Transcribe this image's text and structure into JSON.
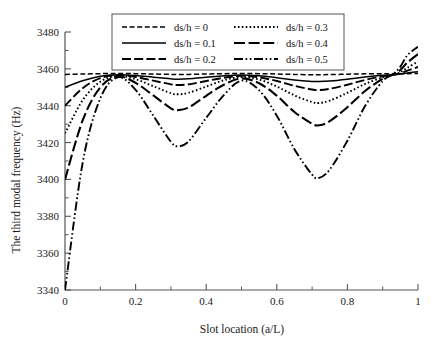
{
  "chart_data": {
    "type": "line",
    "title": "",
    "xlabel": "Slot location (a/L)",
    "ylabel": "The third modal frequency (Hz)",
    "xlim": [
      0,
      1
    ],
    "ylim": [
      3340,
      3480
    ],
    "xticks": [
      "0",
      "0.2",
      "0.4",
      "0.6",
      "0.8",
      "1"
    ],
    "xtick_values": [
      0,
      0.2,
      0.4,
      0.6,
      0.8,
      1
    ],
    "yticks": [
      "3340",
      "3360",
      "3380",
      "3400",
      "3420",
      "3440",
      "3460",
      "3480"
    ],
    "ytick_values": [
      3340,
      3360,
      3380,
      3400,
      3420,
      3440,
      3460,
      3480
    ],
    "grid": false,
    "minor_ticks": true,
    "legend_position": "top-inside",
    "series": [
      {
        "name": "ds/h = 0",
        "style": "dashed",
        "x": [
          0,
          0.05,
          0.1,
          0.15,
          0.2,
          0.25,
          0.3,
          0.32,
          0.35,
          0.4,
          0.45,
          0.5,
          0.55,
          0.6,
          0.65,
          0.7,
          0.72,
          0.75,
          0.8,
          0.85,
          0.9,
          0.93,
          0.95,
          0.97,
          1.0
        ],
        "y": [
          3457.0,
          3457.2,
          3457.4,
          3457.5,
          3457.4,
          3457.2,
          3457.0,
          3456.9,
          3457.0,
          3457.2,
          3457.4,
          3457.5,
          3457.4,
          3457.2,
          3457.0,
          3456.8,
          3456.8,
          3456.9,
          3457.1,
          3457.3,
          3457.4,
          3457.4,
          3457.4,
          3457.4,
          3457.5
        ]
      },
      {
        "name": "ds/h = 0.1",
        "style": "solid",
        "x": [
          0,
          0.05,
          0.1,
          0.15,
          0.2,
          0.25,
          0.3,
          0.32,
          0.35,
          0.4,
          0.45,
          0.5,
          0.55,
          0.6,
          0.65,
          0.7,
          0.72,
          0.75,
          0.8,
          0.85,
          0.9,
          0.93,
          0.95,
          0.97,
          1.0
        ],
        "y": [
          3450.0,
          3453.5,
          3456.0,
          3456.8,
          3456.4,
          3455.5,
          3454.6,
          3454.4,
          3454.6,
          3455.4,
          3456.2,
          3456.6,
          3456.2,
          3455.2,
          3454.0,
          3453.2,
          3453.1,
          3453.4,
          3454.4,
          3455.6,
          3456.5,
          3456.8,
          3457.2,
          3457.8,
          3458.5
        ]
      },
      {
        "name": "ds/h = 0.2",
        "style": "dash-long",
        "x": [
          0,
          0.05,
          0.1,
          0.15,
          0.2,
          0.25,
          0.3,
          0.32,
          0.35,
          0.4,
          0.45,
          0.5,
          0.55,
          0.6,
          0.65,
          0.7,
          0.72,
          0.75,
          0.8,
          0.85,
          0.9,
          0.93,
          0.95,
          0.97,
          1.0
        ],
        "y": [
          3440.0,
          3449.5,
          3455.0,
          3456.6,
          3455.6,
          3453.6,
          3451.6,
          3451.2,
          3451.6,
          3453.4,
          3455.2,
          3456.2,
          3455.4,
          3453.4,
          3450.8,
          3448.8,
          3448.5,
          3449.2,
          3451.4,
          3454.0,
          3456.0,
          3456.8,
          3457.6,
          3459.0,
          3461.0
        ]
      },
      {
        "name": "ds/h = 0.3",
        "style": "dotted",
        "x": [
          0,
          0.05,
          0.1,
          0.15,
          0.2,
          0.25,
          0.3,
          0.32,
          0.35,
          0.4,
          0.45,
          0.5,
          0.55,
          0.6,
          0.65,
          0.7,
          0.72,
          0.75,
          0.8,
          0.85,
          0.9,
          0.93,
          0.95,
          0.97,
          1.0
        ],
        "y": [
          3425.0,
          3443.0,
          3453.0,
          3456.2,
          3454.4,
          3450.6,
          3446.8,
          3446.2,
          3447.0,
          3450.4,
          3453.8,
          3455.6,
          3454.2,
          3450.4,
          3445.6,
          3442.0,
          3441.5,
          3442.8,
          3447.0,
          3451.8,
          3455.4,
          3456.8,
          3458.2,
          3460.6,
          3464.0
        ]
      },
      {
        "name": "ds/h = 0.4",
        "style": "dash-med",
        "x": [
          0,
          0.05,
          0.1,
          0.15,
          0.2,
          0.25,
          0.3,
          0.32,
          0.35,
          0.4,
          0.45,
          0.5,
          0.55,
          0.6,
          0.65,
          0.7,
          0.72,
          0.75,
          0.8,
          0.85,
          0.9,
          0.93,
          0.95,
          0.97,
          1.0
        ],
        "y": [
          3400.0,
          3432.0,
          3450.0,
          3455.8,
          3452.4,
          3445.6,
          3438.6,
          3437.6,
          3439.0,
          3445.4,
          3451.4,
          3454.8,
          3452.2,
          3445.4,
          3436.6,
          3430.2,
          3429.4,
          3431.6,
          3439.2,
          3448.0,
          3454.6,
          3457.0,
          3459.4,
          3463.4,
          3468.0
        ]
      },
      {
        "name": "ds/h = 0.5",
        "style": "dash-dot-dot",
        "x": [
          0,
          0.05,
          0.1,
          0.15,
          0.2,
          0.25,
          0.3,
          0.32,
          0.35,
          0.4,
          0.45,
          0.5,
          0.55,
          0.6,
          0.65,
          0.7,
          0.72,
          0.75,
          0.8,
          0.85,
          0.9,
          0.93,
          0.95,
          0.97,
          1.0
        ],
        "y": [
          3340.0,
          3409.0,
          3444.0,
          3455.4,
          3448.6,
          3434.6,
          3420.4,
          3418.0,
          3420.6,
          3433.4,
          3445.8,
          3453.6,
          3448.4,
          3434.6,
          3416.4,
          3402.6,
          3400.8,
          3405.4,
          3421.0,
          3439.8,
          3453.4,
          3457.2,
          3461.2,
          3467.4,
          3472.0
        ]
      }
    ],
    "legend": [
      {
        "label": "ds/h = 0",
        "style": "dashed"
      },
      {
        "label": "ds/h = 0.3",
        "style": "dotted"
      },
      {
        "label": "ds/h = 0.1",
        "style": "solid"
      },
      {
        "label": "ds/h = 0.4",
        "style": "dash-med"
      },
      {
        "label": "ds/h = 0.2",
        "style": "dash-long"
      },
      {
        "label": "ds/h = 0.5",
        "style": "dash-dot-dot"
      }
    ],
    "colors": {
      "line": "#000000",
      "axis": "#555555",
      "text": "#111111"
    }
  }
}
